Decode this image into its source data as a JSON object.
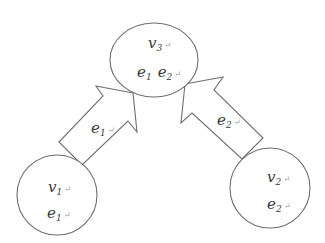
{
  "diagram": {
    "type": "node-flow",
    "colors": {
      "stroke": "#6e6e6e",
      "text": "#3a3a3a",
      "background": "#ffffff"
    },
    "nodes": [
      {
        "id": "v3",
        "name": "v",
        "sub": "3",
        "content": [
          {
            "name": "e",
            "sub": "1"
          },
          {
            "name": "e",
            "sub": "2"
          }
        ]
      },
      {
        "id": "v1",
        "name": "v",
        "sub": "1",
        "content": [
          {
            "name": "e",
            "sub": "1"
          }
        ]
      },
      {
        "id": "v2",
        "name": "v",
        "sub": "2",
        "content": [
          {
            "name": "e",
            "sub": "2"
          }
        ]
      }
    ],
    "edges": [
      {
        "from": "v1",
        "to": "v3",
        "label": {
          "name": "e",
          "sub": "1"
        }
      },
      {
        "from": "v2",
        "to": "v3",
        "label": {
          "name": "e",
          "sub": "2"
        }
      }
    ],
    "return_mark": "↵"
  }
}
